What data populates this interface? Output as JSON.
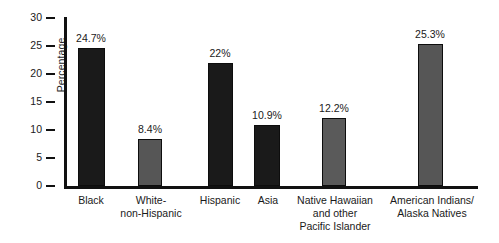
{
  "chart_data": {
    "type": "bar",
    "title": "",
    "xlabel": "",
    "ylabel": "Percentage",
    "ylim": [
      0,
      30
    ],
    "ytick_values": [
      0,
      5,
      10,
      15,
      20,
      25,
      30
    ],
    "ytick_labels": [
      "0",
      "5",
      "10",
      "15",
      "20",
      "25",
      "30"
    ],
    "grid": false,
    "legend": null,
    "categories": [
      "Black",
      "White-\nnon-Hispanic",
      "Hispanic",
      "Asia",
      "Native Hawaiian\nand other\nPacific Islander",
      "American Indians/\nAlaska Natives"
    ],
    "values": [
      24.7,
      8.4,
      22.0,
      10.9,
      12.2,
      25.3
    ],
    "data_labels": [
      "24.7%",
      "8.4%",
      "22%",
      "10.9%",
      "12.2%",
      "25.3%"
    ],
    "bar_colors": [
      "#1a1a1a",
      "#565656",
      "#1a1a1a",
      "#1a1a1a",
      "#5a5a5a",
      "#565656"
    ],
    "bar_edge_color": "#0d0d0d",
    "axis_color": "#111111",
    "background_color": "#ffffff"
  }
}
